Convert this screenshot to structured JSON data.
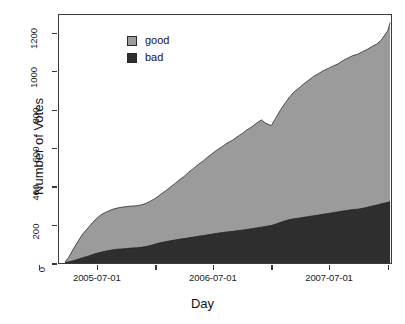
{
  "chart_data": {
    "type": "area",
    "title": "",
    "xlabel": "Day",
    "ylabel": "Number of Votes",
    "stacked": true,
    "grid": false,
    "legend_position": "top-left",
    "ylim": [
      0,
      1300
    ],
    "yticks": [
      0,
      200,
      400,
      600,
      800,
      1000,
      1200
    ],
    "ytick_labels": [
      "0",
      "200",
      "400",
      "600",
      "800",
      "1000",
      "1200"
    ],
    "xlim": [
      "2005-03-01",
      "2008-01-15"
    ],
    "xticks": [
      "2005-01-01",
      "2005-07-01",
      "2006-01-01",
      "2006-07-01",
      "2007-01-01",
      "2007-07-01",
      "2008-01-01"
    ],
    "xtick_labels": [
      "",
      "2005-07-01",
      "",
      "2006-07-01",
      "",
      "2007-07-01",
      ""
    ],
    "colors": {
      "good": "#9b9b9b",
      "bad": "#2e2e2e",
      "frame": "#3a3a3a",
      "text": "#141414"
    },
    "x": [
      "2005-03-20",
      "2005-04-01",
      "2005-04-15",
      "2005-05-01",
      "2005-05-15",
      "2005-06-01",
      "2005-06-15",
      "2005-07-01",
      "2005-07-15",
      "2005-08-01",
      "2005-08-15",
      "2005-09-01",
      "2005-09-15",
      "2005-10-01",
      "2005-10-15",
      "2005-11-01",
      "2005-11-15",
      "2005-12-01",
      "2005-12-15",
      "2006-01-01",
      "2006-01-15",
      "2006-02-01",
      "2006-02-15",
      "2006-03-01",
      "2006-03-15",
      "2006-04-01",
      "2006-04-15",
      "2006-05-01",
      "2006-05-15",
      "2006-06-01",
      "2006-06-15",
      "2006-07-01",
      "2006-07-15",
      "2006-08-01",
      "2006-08-15",
      "2006-09-01",
      "2006-09-15",
      "2006-10-01",
      "2006-10-15",
      "2006-11-01",
      "2006-11-15",
      "2006-12-01",
      "2006-12-15",
      "2007-01-01",
      "2007-01-15",
      "2007-02-01",
      "2007-02-15",
      "2007-03-01",
      "2007-03-15",
      "2007-04-01",
      "2007-04-15",
      "2007-05-01",
      "2007-05-15",
      "2007-06-01",
      "2007-06-15",
      "2007-07-01",
      "2007-07-15",
      "2007-08-01",
      "2007-08-15",
      "2007-09-01",
      "2007-09-15",
      "2007-10-01",
      "2007-10-15",
      "2007-11-01",
      "2007-11-15",
      "2007-12-01",
      "2007-12-15",
      "2008-01-05",
      "2008-01-12"
    ],
    "series": [
      {
        "name": "bad",
        "color": "#2e2e2e",
        "values": [
          2,
          6,
          12,
          20,
          28,
          36,
          44,
          52,
          58,
          64,
          68,
          72,
          74,
          76,
          78,
          80,
          82,
          86,
          92,
          100,
          106,
          112,
          116,
          120,
          124,
          128,
          132,
          136,
          140,
          144,
          148,
          152,
          156,
          160,
          163,
          166,
          169,
          172,
          176,
          180,
          184,
          188,
          192,
          196,
          204,
          214,
          222,
          228,
          232,
          236,
          240,
          244,
          248,
          252,
          256,
          260,
          264,
          268,
          272,
          276,
          280,
          282,
          286,
          292,
          298,
          304,
          310,
          318,
          322
        ]
      },
      {
        "name": "good",
        "color": "#9b9b9b",
        "values": [
          4,
          24,
          60,
          96,
          124,
          148,
          168,
          186,
          198,
          206,
          212,
          216,
          218,
          220,
          220,
          220,
          222,
          226,
          232,
          240,
          252,
          266,
          280,
          294,
          310,
          326,
          344,
          360,
          376,
          392,
          408,
          424,
          438,
          452,
          466,
          478,
          492,
          506,
          520,
          534,
          548,
          562,
          540,
          524,
          554,
          592,
          618,
          644,
          666,
          684,
          700,
          716,
          730,
          742,
          752,
          760,
          768,
          776,
          788,
          798,
          806,
          812,
          820,
          828,
          836,
          844,
          858,
          900,
          938
        ]
      }
    ],
    "totals": [
      6,
      30,
      72,
      116,
      152,
      184,
      212,
      238,
      256,
      270,
      280,
      288,
      292,
      296,
      298,
      300,
      304,
      312,
      324,
      340,
      358,
      378,
      396,
      414,
      434,
      454,
      476,
      496,
      516,
      536,
      556,
      576,
      594,
      612,
      629,
      644,
      661,
      678,
      696,
      714,
      732,
      750,
      732,
      720,
      758,
      806,
      840,
      872,
      898,
      920,
      940,
      960,
      978,
      994,
      1008,
      1020,
      1032,
      1044,
      1060,
      1074,
      1086,
      1094,
      1106,
      1120,
      1134,
      1148,
      1168,
      1218,
      1260
    ]
  },
  "legend": {
    "items": [
      {
        "label": "good",
        "color": "#9b9b9b"
      },
      {
        "label": "bad",
        "color": "#2e2e2e"
      }
    ]
  },
  "axes": {
    "x_title": "Day",
    "y_title": "Number of Votes"
  }
}
